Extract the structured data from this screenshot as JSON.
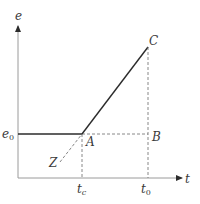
{
  "diagram": {
    "type": "piecewise-linear graph",
    "axes": {
      "y_label": "e",
      "x_label": "t"
    },
    "levels": {
      "e0_label": "e",
      "e0_sub": "0"
    },
    "ticks": {
      "tc_label": "t",
      "tc_sub": "c",
      "t0_label": "t",
      "t0_sub": "0"
    },
    "points": {
      "A": "A",
      "B": "B",
      "C": "C",
      "Z": "Z"
    },
    "colors": {
      "solid_line": "#2b2b2b",
      "dashed_line": "#6a6a6a",
      "axis": "#9a9a9a",
      "text": "#3a3a3a"
    }
  }
}
